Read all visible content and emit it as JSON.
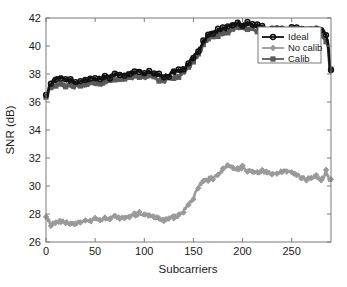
{
  "chart_data": {
    "type": "line",
    "title": "",
    "xlabel": "Subcarriers",
    "ylabel": "SNR (dB)",
    "xlim": [
      0,
      290
    ],
    "ylim": [
      26,
      42
    ],
    "xticks": [
      0,
      50,
      100,
      150,
      200,
      250
    ],
    "yticks": [
      26,
      28,
      30,
      32,
      34,
      36,
      38,
      40,
      42
    ],
    "xtick_labels": [
      "0",
      "50",
      "100",
      "150",
      "200",
      "250"
    ],
    "ytick_labels": [
      "26",
      "28",
      "30",
      "32",
      "34",
      "36",
      "38",
      "40",
      "42"
    ],
    "grid": false,
    "legend_position": "upper right",
    "legend_entries": [
      "Ideal",
      "No calib",
      "Calib"
    ],
    "series": [
      {
        "name": "Ideal",
        "color": "#111111",
        "marker": "circle",
        "x": [
          0,
          5,
          10,
          15,
          20,
          25,
          30,
          35,
          40,
          45,
          50,
          55,
          60,
          65,
          70,
          75,
          80,
          85,
          90,
          95,
          100,
          105,
          110,
          115,
          120,
          125,
          130,
          135,
          140,
          145,
          150,
          155,
          160,
          165,
          170,
          175,
          180,
          185,
          190,
          195,
          200,
          205,
          210,
          215,
          220,
          225,
          230,
          235,
          240,
          245,
          250,
          255,
          260,
          265,
          270,
          275,
          280,
          283,
          285,
          287,
          288,
          289
        ],
        "values": [
          36.4,
          37.4,
          37.6,
          37.7,
          37.6,
          37.5,
          37.4,
          37.5,
          37.6,
          37.6,
          37.7,
          37.7,
          37.8,
          37.8,
          37.9,
          38.0,
          37.9,
          38.0,
          38.1,
          38.2,
          38.1,
          38.2,
          38.0,
          37.9,
          37.8,
          37.9,
          38.1,
          38.2,
          38.4,
          38.7,
          39.2,
          39.7,
          40.3,
          40.8,
          41.0,
          41.1,
          41.2,
          41.3,
          41.5,
          41.6,
          41.5,
          41.6,
          41.5,
          41.4,
          41.3,
          41.2,
          41.2,
          41.2,
          41.2,
          41.2,
          41.2,
          41.2,
          41.2,
          41.2,
          41.2,
          41.2,
          41.1,
          41.0,
          40.8,
          40.2,
          39.3,
          38.3
        ]
      },
      {
        "name": "Calib",
        "color": "#5a5a5a",
        "marker": "square",
        "x": [
          0,
          5,
          10,
          15,
          20,
          25,
          30,
          35,
          40,
          45,
          50,
          55,
          60,
          65,
          70,
          75,
          80,
          85,
          90,
          95,
          100,
          105,
          110,
          115,
          120,
          125,
          130,
          135,
          140,
          145,
          150,
          155,
          160,
          165,
          170,
          175,
          180,
          185,
          190,
          195,
          200,
          205,
          210,
          215,
          220,
          225,
          230,
          235,
          240,
          245,
          250,
          255,
          260,
          265,
          270,
          275,
          280,
          283,
          285,
          287,
          288,
          289
        ],
        "values": [
          36.3,
          37.0,
          37.2,
          37.3,
          37.2,
          37.1,
          37.1,
          37.2,
          37.2,
          37.3,
          37.3,
          37.3,
          37.4,
          37.5,
          37.6,
          37.7,
          37.6,
          37.7,
          37.8,
          37.9,
          37.8,
          37.8,
          37.7,
          37.6,
          37.5,
          37.6,
          37.8,
          37.9,
          38.1,
          38.4,
          38.9,
          39.4,
          40.0,
          40.5,
          40.7,
          40.8,
          40.9,
          41.0,
          41.2,
          41.3,
          41.3,
          41.3,
          41.2,
          41.1,
          41.0,
          40.9,
          40.9,
          40.9,
          40.9,
          40.9,
          40.9,
          40.9,
          40.9,
          40.9,
          40.9,
          40.8,
          40.7,
          40.6,
          40.4,
          39.9,
          39.1,
          38.2
        ]
      },
      {
        "name": "No calib",
        "color": "#9a9a9a",
        "marker": "diamond",
        "x": [
          0,
          5,
          10,
          15,
          20,
          25,
          30,
          35,
          40,
          45,
          50,
          55,
          60,
          65,
          70,
          75,
          80,
          85,
          90,
          95,
          100,
          105,
          110,
          115,
          120,
          125,
          130,
          135,
          140,
          145,
          150,
          155,
          160,
          165,
          170,
          175,
          180,
          185,
          190,
          195,
          200,
          205,
          210,
          215,
          220,
          225,
          230,
          235,
          240,
          245,
          250,
          255,
          260,
          265,
          270,
          275,
          280,
          283,
          285,
          287,
          288,
          289
        ],
        "values": [
          27.8,
          27.3,
          27.4,
          27.5,
          27.4,
          27.3,
          27.3,
          27.4,
          27.5,
          27.5,
          27.6,
          27.6,
          27.7,
          27.7,
          27.8,
          27.8,
          27.7,
          27.8,
          27.9,
          28.0,
          27.9,
          27.9,
          27.8,
          27.7,
          27.6,
          27.7,
          27.8,
          27.9,
          28.2,
          28.6,
          29.2,
          29.9,
          30.4,
          30.5,
          30.6,
          30.8,
          31.2,
          31.5,
          31.3,
          31.2,
          31.3,
          31.1,
          31.0,
          30.9,
          31.0,
          31.0,
          30.9,
          31.0,
          31.1,
          31.0,
          30.9,
          30.8,
          30.6,
          30.5,
          30.6,
          30.7,
          30.5,
          30.6,
          31.1,
          30.7,
          30.5,
          30.4
        ]
      }
    ]
  },
  "axes": {
    "xlabel": "Subcarriers",
    "ylabel": "SNR (dB)"
  },
  "legend": {
    "items": [
      {
        "label": "Ideal",
        "color": "#111111",
        "marker": "circle"
      },
      {
        "label": "No calib",
        "color": "#9a9a9a",
        "marker": "diamond"
      },
      {
        "label": "Calib",
        "color": "#5a5a5a",
        "marker": "square"
      }
    ]
  }
}
